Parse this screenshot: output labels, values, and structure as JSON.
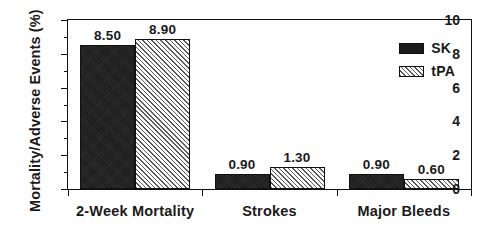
{
  "chart_data": {
    "type": "bar",
    "title": "",
    "subtitle": "",
    "xlabel": "",
    "ylabel": "Mortality/Adverse Events (%)",
    "categories": [
      "2-Week Mortality",
      "Strokes",
      "Major Bleeds"
    ],
    "series": [
      {
        "name": "SK",
        "values": [
          8.5,
          0.9,
          0.9
        ],
        "labels": [
          "8.50",
          "0.90",
          "0.90"
        ],
        "fill": "solid-black",
        "color": "#1b1b1b"
      },
      {
        "name": "tPA",
        "values": [
          8.9,
          1.3,
          0.6
        ],
        "labels": [
          "8.90",
          "1.30",
          "0.60"
        ],
        "fill": "diagonal-hatch",
        "color": "#f2f2f2"
      }
    ],
    "ylim": [
      0,
      10
    ],
    "yticks": [
      0,
      2,
      4,
      6,
      8,
      10
    ],
    "ytick_labels": [
      "0",
      "2",
      "4",
      "6",
      "8",
      "10"
    ],
    "yminor_ticks": [
      1,
      3,
      5,
      7,
      9
    ],
    "grid": false,
    "legend_position": "top-right-inside",
    "frame": "full-box",
    "background": "#ffffff",
    "foreground": "#101010"
  },
  "legend": {
    "entries": [
      {
        "label": "SK"
      },
      {
        "label": "tPA"
      }
    ]
  },
  "axes": {
    "y_title": "Mortality/Adverse Events (%)"
  }
}
